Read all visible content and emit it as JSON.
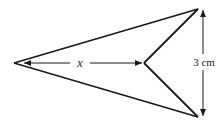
{
  "diagram": {
    "shape": "arrowhead (concave quadrilateral / dart)",
    "vertices": {
      "left_tip": [
        14,
        63
      ],
      "top_right": [
        198,
        9
      ],
      "inner": [
        144,
        63
      ],
      "bottom_right": [
        198,
        117
      ]
    },
    "labels": {
      "horizontal_length": "x",
      "vertical_length": "3 cm"
    },
    "colors": {
      "stroke": "#1a1a1a",
      "background": "#ffffff"
    }
  }
}
